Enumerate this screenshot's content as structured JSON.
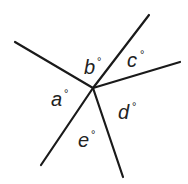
{
  "diagram": {
    "center": [
      93,
      88
    ],
    "rays": [
      {
        "name": "ray-upper-left",
        "end": [
          15,
          42
        ]
      },
      {
        "name": "ray-upper-right",
        "end": [
          149,
          15
        ]
      },
      {
        "name": "ray-right",
        "end": [
          180,
          62
        ]
      },
      {
        "name": "ray-lower",
        "end": [
          123,
          177
        ]
      },
      {
        "name": "ray-lower-left",
        "end": [
          41,
          165
        ]
      }
    ],
    "labels": [
      {
        "id": "a",
        "text": "a",
        "degree": "°",
        "pos": [
          51,
          106
        ]
      },
      {
        "id": "b",
        "text": "b",
        "degree": "°",
        "pos": [
          84,
          74
        ]
      },
      {
        "id": "c",
        "text": "c",
        "degree": "°",
        "pos": [
          127,
          67
        ]
      },
      {
        "id": "d",
        "text": "d",
        "degree": "°",
        "pos": [
          118,
          119
        ]
      },
      {
        "id": "e",
        "text": "e",
        "degree": "°",
        "pos": [
          78,
          147
        ]
      }
    ],
    "line_color": "#1a1a1a"
  }
}
